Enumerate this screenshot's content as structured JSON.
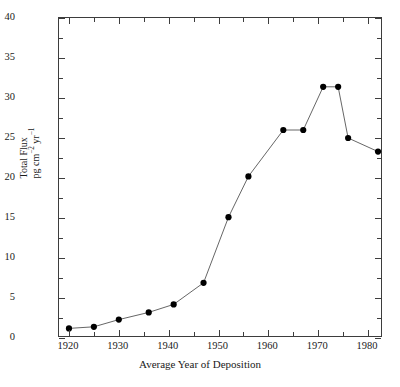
{
  "chart_data": {
    "type": "line",
    "title": "",
    "subtitle": "",
    "xlabel": "Average Year of Deposition",
    "ylabel_line1": "Total Flux",
    "ylabel_line2_prefix": "pg cm",
    "ylabel_line2_exp1": "−2",
    "ylabel_line2_mid": " yr",
    "ylabel_line2_exp2": "−1",
    "ylabel_full": "Total Flux pg cm−2 yr−1",
    "xlim": [
      1918,
      1983
    ],
    "ylim": [
      0,
      40
    ],
    "grid": false,
    "legend": null,
    "marker": "filled-circle",
    "line_color": "#555555",
    "marker_color": "#000000",
    "axis_color": "#3d3d3d",
    "background": "#ffffff",
    "x_major_ticks": [
      1920,
      1930,
      1940,
      1950,
      1960,
      1970,
      1980
    ],
    "x_minor_ticks": [
      1925,
      1935,
      1945,
      1955,
      1965,
      1975
    ],
    "y_major_ticks": [
      0,
      5,
      10,
      15,
      20,
      25,
      30,
      35,
      40
    ],
    "y_tick_labels": [
      "0",
      "5",
      "10",
      "15",
      "20",
      "25",
      "30",
      "35",
      "40"
    ],
    "x_tick_labels": [
      "1920",
      "1930",
      "1940",
      "1950",
      "1960",
      "1970",
      "1980"
    ],
    "x": [
      1920,
      1925,
      1930,
      1936,
      1941,
      1947,
      1952,
      1956,
      1963,
      1967,
      1971,
      1974,
      1976,
      1982
    ],
    "values": [
      1.2,
      1.4,
      2.3,
      3.2,
      4.2,
      6.9,
      15.1,
      20.2,
      26.0,
      26.0,
      31.4,
      31.4,
      25.0,
      23.3
    ],
    "points": [
      {
        "x": 1920,
        "y": 1.2
      },
      {
        "x": 1925,
        "y": 1.4
      },
      {
        "x": 1930,
        "y": 2.3
      },
      {
        "x": 1936,
        "y": 3.2
      },
      {
        "x": 1941,
        "y": 4.2
      },
      {
        "x": 1947,
        "y": 6.9
      },
      {
        "x": 1952,
        "y": 15.1
      },
      {
        "x": 1956,
        "y": 20.2
      },
      {
        "x": 1963,
        "y": 26.0
      },
      {
        "x": 1967,
        "y": 26.0
      },
      {
        "x": 1971,
        "y": 31.4
      },
      {
        "x": 1974,
        "y": 31.4
      },
      {
        "x": 1976,
        "y": 25.0
      },
      {
        "x": 1982,
        "y": 23.3
      }
    ]
  },
  "caption": {
    "partial_text": ""
  }
}
